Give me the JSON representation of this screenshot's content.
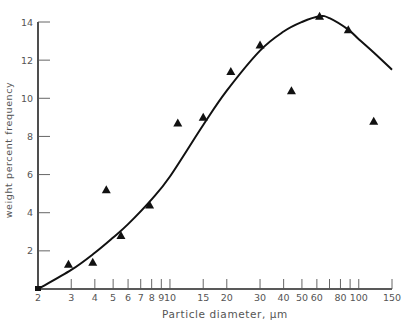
{
  "chart_data": {
    "type": "scatter",
    "title": "",
    "xlabel": "Particle diameter, μm",
    "ylabel": "weight percent frequency",
    "x_scale": "log",
    "xlim": [
      2,
      150
    ],
    "ylim": [
      0,
      14
    ],
    "grid": false,
    "legend": null,
    "x_ticks_major": [
      {
        "value": 2,
        "label": "2"
      },
      {
        "value": 3,
        "label": "3"
      },
      {
        "value": 4,
        "label": "4"
      },
      {
        "value": 5,
        "label": "5"
      },
      {
        "value": 6,
        "label": "6"
      },
      {
        "value": 7,
        "label": "7"
      },
      {
        "value": 8,
        "label": "8"
      },
      {
        "value": 9,
        "label": "9"
      },
      {
        "value": 10,
        "label": "10"
      },
      {
        "value": 15,
        "label": "15"
      },
      {
        "value": 20,
        "label": "20"
      },
      {
        "value": 30,
        "label": "30"
      },
      {
        "value": 40,
        "label": "40"
      },
      {
        "value": 50,
        "label": "50"
      },
      {
        "value": 60,
        "label": "60"
      },
      {
        "value": 70,
        "label": ""
      },
      {
        "value": 80,
        "label": "80"
      },
      {
        "value": 90,
        "label": ""
      },
      {
        "value": 100,
        "label": "100"
      },
      {
        "value": 150,
        "label": "150"
      }
    ],
    "y_ticks": [
      {
        "value": 2,
        "label": "2"
      },
      {
        "value": 4,
        "label": "4"
      },
      {
        "value": 6,
        "label": "6"
      },
      {
        "value": 8,
        "label": "8"
      },
      {
        "value": 10,
        "label": "10"
      },
      {
        "value": 12,
        "label": "12"
      },
      {
        "value": 14,
        "label": "14"
      }
    ],
    "series": [
      {
        "name": "measured",
        "marker": "triangle",
        "x": [
          2.9,
          3.9,
          4.6,
          5.5,
          7.8,
          11,
          15,
          21,
          30,
          44,
          62,
          88,
          120
        ],
        "y": [
          1.3,
          1.4,
          5.2,
          2.8,
          4.4,
          8.7,
          9.0,
          11.4,
          12.8,
          10.4,
          14.3,
          13.6,
          8.8
        ]
      },
      {
        "name": "fitted curve",
        "marker": "line",
        "x": [
          2,
          3,
          4,
          5,
          6,
          8,
          10,
          15,
          20,
          30,
          40,
          50,
          62,
          70,
          88,
          100,
          120,
          150
        ],
        "y": [
          0,
          1.0,
          1.9,
          2.7,
          3.4,
          4.7,
          5.9,
          8.6,
          10.4,
          12.5,
          13.5,
          14.0,
          14.3,
          14.2,
          13.6,
          13.1,
          12.4,
          11.5
        ]
      }
    ]
  }
}
